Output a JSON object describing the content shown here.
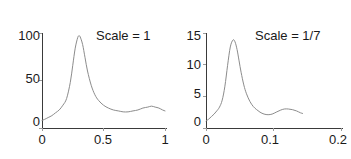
{
  "figure": {
    "background_color": "#ffffff",
    "curve_color": "#8c8c8c",
    "axis_color": "#3a3a3a",
    "text_color": "#1a1a1a"
  },
  "chart_data": [
    {
      "type": "line",
      "title": "",
      "annotation": "Scale = 1",
      "xlabel": "",
      "ylabel": "",
      "xlim": [
        0,
        1
      ],
      "ylim": [
        0,
        100
      ],
      "grid": false,
      "legend": "none",
      "xticks": [
        0,
        0.5,
        1
      ],
      "xticklabels": [
        "0",
        "0.5",
        "1"
      ],
      "yticks": [
        0,
        50,
        100
      ],
      "yticklabels": [
        "0",
        "50",
        "100"
      ],
      "series": [
        {
          "name": "spectral density",
          "x": [
            0.0,
            0.02,
            0.05,
            0.08,
            0.11,
            0.14,
            0.17,
            0.2,
            0.23,
            0.25,
            0.27,
            0.29,
            0.3,
            0.31,
            0.33,
            0.35,
            0.37,
            0.4,
            0.43,
            0.46,
            0.5,
            0.54,
            0.58,
            0.62,
            0.66,
            0.7,
            0.74,
            0.78,
            0.82,
            0.86,
            0.89,
            0.92,
            0.95,
            0.98,
            1.0
          ],
          "y": [
            8,
            9,
            11,
            13,
            16,
            19,
            24,
            31,
            48,
            66,
            84,
            95,
            97,
            96,
            88,
            74,
            60,
            45,
            35,
            29,
            24,
            21,
            19,
            18,
            17,
            17,
            18,
            19,
            21,
            22,
            23,
            22,
            21,
            19,
            18
          ]
        }
      ]
    },
    {
      "type": "line",
      "title": "",
      "annotation": "Scale = 1/7",
      "xlabel": "",
      "ylabel": "",
      "xlim": [
        0,
        0.2
      ],
      "ylim": [
        0,
        15
      ],
      "grid": false,
      "legend": "none",
      "xticks": [
        0,
        0.1,
        0.2
      ],
      "xticklabels": [
        "0",
        "0.1",
        "0.2"
      ],
      "yticks": [
        0,
        5,
        10,
        15
      ],
      "yticklabels": [
        "0",
        "5",
        "10",
        "15"
      ],
      "series": [
        {
          "name": "spectral density",
          "x": [
            0.0,
            0.004,
            0.008,
            0.012,
            0.016,
            0.02,
            0.024,
            0.028,
            0.032,
            0.036,
            0.04,
            0.043,
            0.046,
            0.049,
            0.052,
            0.056,
            0.06,
            0.065,
            0.07,
            0.075,
            0.08,
            0.086,
            0.092,
            0.098,
            0.104,
            0.11,
            0.116,
            0.122,
            0.128,
            0.134,
            0.14,
            0.143
          ],
          "y": [
            1.1,
            1.4,
            1.8,
            2.2,
            2.7,
            3.3,
            4.4,
            6.6,
            9.9,
            12.8,
            13.9,
            13.6,
            12.4,
            10.6,
            8.8,
            6.8,
            5.4,
            4.2,
            3.4,
            2.9,
            2.5,
            2.2,
            2.1,
            2.2,
            2.5,
            2.8,
            3.0,
            3.0,
            2.9,
            2.7,
            2.4,
            2.3
          ]
        }
      ]
    }
  ]
}
